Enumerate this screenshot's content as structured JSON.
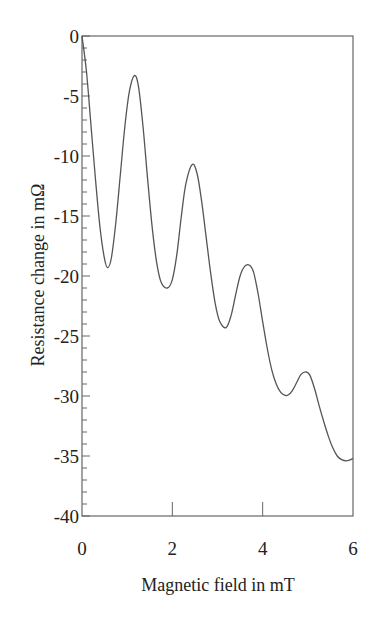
{
  "chart_data": {
    "type": "line",
    "title": "",
    "xlabel": "Magnetic field in mT",
    "ylabel": "Resistance change in mΩ",
    "xlim": [
      0,
      6
    ],
    "ylim": [
      -40,
      0
    ],
    "xticks": [
      0,
      2,
      4,
      6
    ],
    "xtick_labels": [
      "0",
      "2",
      "4",
      "6"
    ],
    "yticks": [
      0,
      -5,
      -10,
      -15,
      -20,
      -25,
      -30,
      -35,
      -40
    ],
    "ytick_labels": [
      "0",
      "-5",
      "-10",
      "-15",
      "-20",
      "-25",
      "-30",
      "-35",
      "-40"
    ],
    "y_minor_step": 1,
    "grid": false,
    "legend": null,
    "line_color": "#555555",
    "series": [
      {
        "name": "Resistance change",
        "x": [
          0.0,
          0.1,
          0.2,
          0.3,
          0.4,
          0.5,
          0.57,
          0.65,
          0.75,
          0.85,
          0.95,
          1.05,
          1.16,
          1.25,
          1.35,
          1.45,
          1.55,
          1.65,
          1.75,
          1.89,
          2.0,
          2.1,
          2.2,
          2.3,
          2.44,
          2.55,
          2.65,
          2.75,
          2.85,
          2.95,
          3.05,
          3.19,
          3.3,
          3.4,
          3.5,
          3.6,
          3.71,
          3.8,
          3.9,
          4.0,
          4.1,
          4.2,
          4.3,
          4.4,
          4.5,
          4.57,
          4.65,
          4.75,
          4.85,
          4.97,
          5.05,
          5.15,
          5.25,
          5.35,
          5.45,
          5.55,
          5.65,
          5.75,
          5.85,
          5.95,
          6.0
        ],
        "values": [
          0.0,
          -3.0,
          -7.5,
          -12.0,
          -16.0,
          -18.6,
          -19.3,
          -18.5,
          -15.5,
          -11.5,
          -7.5,
          -4.6,
          -3.3,
          -4.2,
          -7.5,
          -11.8,
          -15.8,
          -18.8,
          -20.5,
          -21.0,
          -20.3,
          -18.2,
          -15.0,
          -12.3,
          -10.7,
          -11.5,
          -13.8,
          -16.8,
          -19.8,
          -22.3,
          -23.8,
          -24.3,
          -23.3,
          -21.6,
          -20.0,
          -19.2,
          -19.1,
          -19.7,
          -21.5,
          -23.8,
          -26.0,
          -27.8,
          -29.0,
          -29.7,
          -29.95,
          -29.9,
          -29.6,
          -28.9,
          -28.2,
          -28.0,
          -28.3,
          -29.4,
          -30.8,
          -32.1,
          -33.3,
          -34.3,
          -35.0,
          -35.3,
          -35.4,
          -35.3,
          -35.2
        ]
      }
    ]
  }
}
